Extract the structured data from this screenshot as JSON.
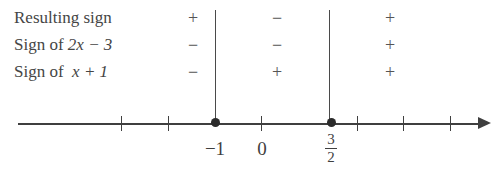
{
  "figure": {
    "type": "sign-chart-number-line"
  },
  "rows": [
    {
      "label_prefix": "Resulting sign",
      "expression": "",
      "signs": [
        "+",
        "−",
        "+"
      ]
    },
    {
      "label_prefix": "Sign of ",
      "expression": "2x − 3",
      "signs": [
        "−",
        "−",
        "+"
      ]
    },
    {
      "label_prefix": "Sign of ",
      "expression": "x + 1",
      "signs": [
        "−",
        "+",
        "+"
      ]
    }
  ],
  "dividers": [
    {
      "at_label": "−1",
      "x": 215
    },
    {
      "at_label": "3/2",
      "x": 329
    }
  ],
  "axis": {
    "ticks": [
      121,
      168,
      261,
      357,
      403,
      450
    ],
    "points": [
      {
        "x": 215,
        "label": "−1",
        "kind": "plain"
      },
      {
        "x": 331,
        "label": "3/2",
        "kind": "fraction",
        "numerator": "3",
        "denominator": "2"
      }
    ],
    "origin": {
      "x": 262,
      "label": "0"
    },
    "arrow_direction": "right"
  },
  "colors": {
    "ink": "#3f3f3f",
    "text": "#454545",
    "sign": "#555555",
    "background": "#ffffff"
  }
}
